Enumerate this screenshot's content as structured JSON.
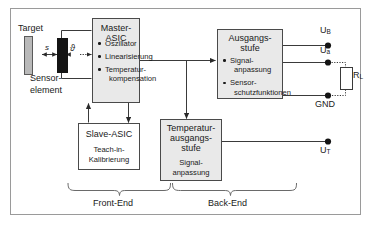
{
  "diagram": {
    "frame_color": "#9a9a9a",
    "line_color": "#3a3a3a",
    "block_fill_gray": "#e9e9e9",
    "block_fill_white": "#ffffff",
    "target_fill": "#b9b9b9",
    "sensor_fill": "#141414"
  },
  "front_end": {
    "section_label": "Front-End",
    "target_label": "Target",
    "sensor_label_line1": "Sensor-",
    "sensor_label_line2": "element",
    "distance_symbol": "s",
    "temperature_symbol": "ϑ",
    "master": {
      "title": "Master-ASIC",
      "bullets": [
        {
          "line1": "Oszillator",
          "line2": ""
        },
        {
          "line1": "Linearisierung",
          "line2": ""
        },
        {
          "line1": "Temperatur-",
          "line2": "kompensation"
        }
      ]
    },
    "slave": {
      "title": "Slave-ASIC",
      "sub_line1": "Teach-in-",
      "sub_line2": "Kalibrierung"
    }
  },
  "back_end": {
    "section_label": "Back-End",
    "output_stage": {
      "title_line1": "Ausgangs-",
      "title_line2": "stufe",
      "bullets": [
        {
          "line1": "Signal-",
          "line2": "anpassung"
        },
        {
          "line1": "Sensor-",
          "line2": "schutzfunktionen"
        }
      ]
    },
    "temp_output_stage": {
      "title_line1": "Temperatur-",
      "title_line2": "ausgangs-",
      "title_line3": "stufe",
      "sub_line1": "Signal-",
      "sub_line2": "anpassung"
    }
  },
  "terminals": [
    {
      "name": "supply-voltage",
      "label_main": "U",
      "label_sub": "B",
      "full": "UB"
    },
    {
      "name": "output-voltage",
      "label_main": "U",
      "label_sub": "a",
      "full": "Ua"
    },
    {
      "name": "ground",
      "label_main": "GND",
      "label_sub": "",
      "full": "GND"
    },
    {
      "name": "temperature-output",
      "label_main": "U",
      "label_sub": "T",
      "full": "UT"
    }
  ],
  "load_resistor": {
    "label_main": "R",
    "label_sub": "L",
    "full": "RL"
  }
}
